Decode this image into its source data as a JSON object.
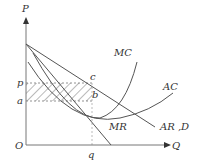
{
  "diagram": {
    "axes": {
      "y_label": "P",
      "x_label": "Q",
      "origin_label": "O"
    },
    "price_labels": {
      "p": "p",
      "a": "a"
    },
    "quantity_label": "q",
    "points": {
      "c": "c",
      "b": "b"
    },
    "curves": {
      "mc": "MC",
      "ac": "AC",
      "mr": "MR",
      "ard": "AR ,D"
    },
    "colors": {
      "line": "#555555",
      "hatch": "#666666",
      "axis": "#777777"
    }
  }
}
